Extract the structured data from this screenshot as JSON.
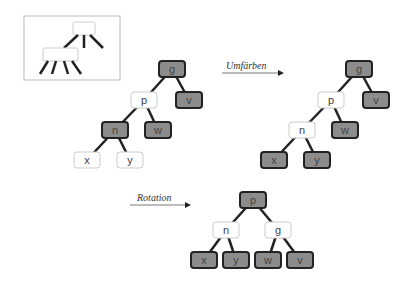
{
  "legend": {
    "description": "schematic of a node with three children and a node with four children"
  },
  "arrows": [
    {
      "label": "Umfärben"
    },
    {
      "label": "Rotation"
    }
  ],
  "trees": [
    {
      "name": "before",
      "nodes": [
        {
          "id": "g",
          "label": "g",
          "color": "dark"
        },
        {
          "id": "p",
          "label": "p",
          "color": "white"
        },
        {
          "id": "v",
          "label": "v",
          "color": "dark"
        },
        {
          "id": "n",
          "label": "n",
          "color": "dark"
        },
        {
          "id": "w",
          "label": "w",
          "color": "dark"
        },
        {
          "id": "x",
          "label": "x",
          "color": "white"
        },
        {
          "id": "y",
          "label": "y",
          "color": "white"
        }
      ]
    },
    {
      "name": "after-recolor",
      "nodes": [
        {
          "id": "g",
          "label": "g",
          "color": "dark"
        },
        {
          "id": "p",
          "label": "p",
          "color": "white"
        },
        {
          "id": "v",
          "label": "v",
          "color": "dark"
        },
        {
          "id": "n",
          "label": "n",
          "color": "white"
        },
        {
          "id": "w",
          "label": "w",
          "color": "dark"
        },
        {
          "id": "x",
          "label": "x",
          "color": "dark"
        },
        {
          "id": "y",
          "label": "y",
          "color": "dark"
        }
      ]
    },
    {
      "name": "after-rotation",
      "nodes": [
        {
          "id": "p",
          "label": "p",
          "color": "dark"
        },
        {
          "id": "n",
          "label": "n",
          "color": "white"
        },
        {
          "id": "g",
          "label": "g",
          "color": "white"
        },
        {
          "id": "x",
          "label": "x",
          "color": "dark"
        },
        {
          "id": "y",
          "label": "y",
          "color": "dark"
        },
        {
          "id": "w",
          "label": "w",
          "color": "dark"
        },
        {
          "id": "v",
          "label": "v",
          "color": "dark"
        }
      ]
    }
  ],
  "colors": {
    "dark": "#8c8c8c",
    "white": "#ffffff",
    "edge": "#222222",
    "whiteBorder": "#cccccc"
  }
}
